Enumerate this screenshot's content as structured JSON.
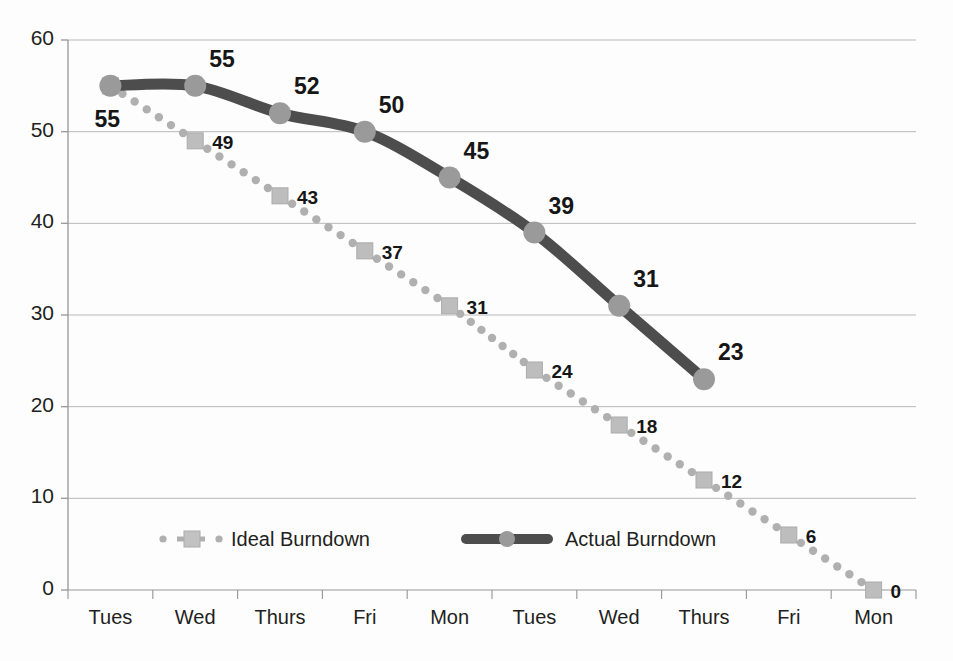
{
  "chart_data": {
    "type": "line",
    "title": "",
    "subtitle": "",
    "xlabel": "",
    "ylabel": "",
    "categories": [
      "Tues",
      "Wed",
      "Thurs",
      "Fri",
      "Mon",
      "Tues",
      "Wed",
      "Thurs",
      "Fri",
      "Mon"
    ],
    "ylim": [
      0,
      60
    ],
    "yticks": [
      0,
      10,
      20,
      30,
      40,
      50,
      60
    ],
    "ytick_labels": [
      "0",
      "10",
      "20",
      "30",
      "40",
      "50",
      "60"
    ],
    "grid": "horizontal",
    "legend_position": "inside-bottom-left",
    "series": [
      {
        "name": "Ideal Burndown",
        "style": "dotted",
        "marker": "square",
        "color": "#a8a8a8",
        "marker_color": "#bdbdbd",
        "values": [
          55,
          49,
          43,
          37,
          31,
          24,
          18,
          12,
          6,
          0
        ],
        "labels": [
          "",
          "49",
          "43",
          "37",
          "31",
          "24",
          "18",
          "12",
          "6",
          "0"
        ]
      },
      {
        "name": "Actual Burndown",
        "style": "solid",
        "marker": "circle",
        "color": "#4d4d4d",
        "marker_color": "#9a9a9a",
        "values": [
          55,
          55,
          52,
          50,
          45,
          39,
          31,
          23,
          null,
          null
        ],
        "labels": [
          "55",
          "55",
          "52",
          "50",
          "45",
          "39",
          "31",
          "23",
          "",
          ""
        ]
      }
    ],
    "annotations": []
  },
  "legend": {
    "items": [
      {
        "label": "Ideal Burndown",
        "marker": "square-dotted"
      },
      {
        "label": "Actual Burndown",
        "marker": "circle-solid"
      }
    ]
  },
  "colors": {
    "actual_line": "#4d4d4d",
    "actual_marker": "#9a9a9a",
    "ideal_dot": "#b0b0b0",
    "ideal_marker": "#c2c2c2",
    "grid": "#b9b9b9",
    "axis": "#9c9c9c",
    "text": "#231f20",
    "background": "#fdfdfd"
  }
}
